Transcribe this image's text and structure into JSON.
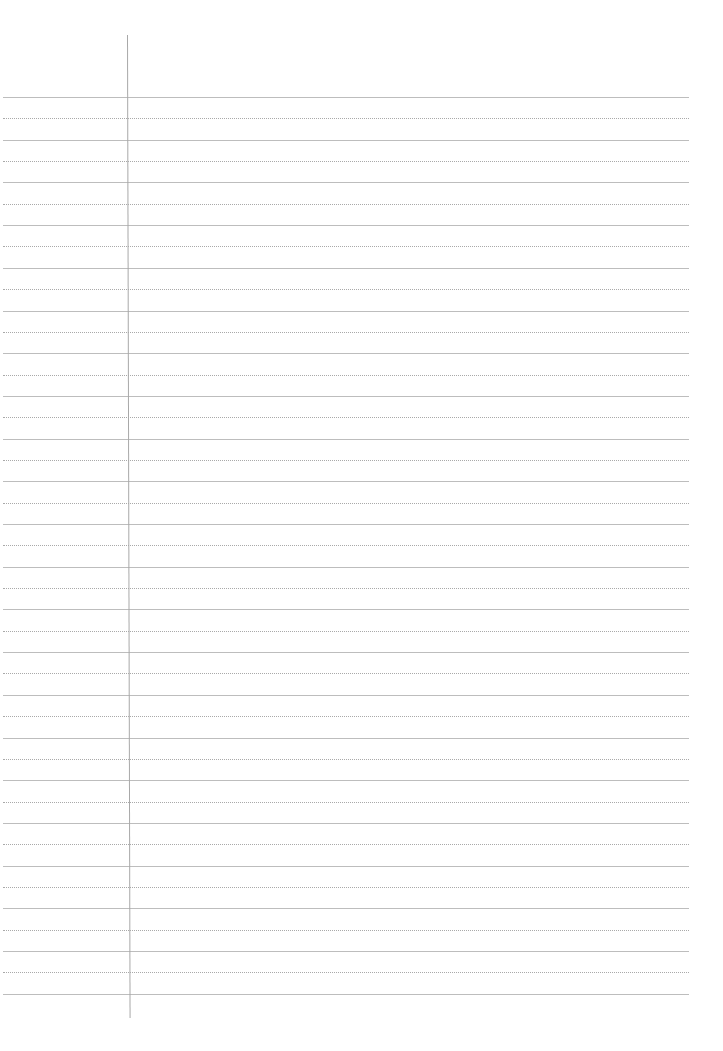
{
  "paper": {
    "type": "lined-notebook-page",
    "background": "#ffffff",
    "solid_line_color": "#bdbdbd",
    "dotted_line_color": "#a9a9a9",
    "margin_line_color": "#a8a8a8",
    "first_rule_y": 97,
    "rule_spacing": 42.7,
    "solid_rule_count": 22,
    "dotted_rule_count": 21,
    "margin_x": 127
  }
}
